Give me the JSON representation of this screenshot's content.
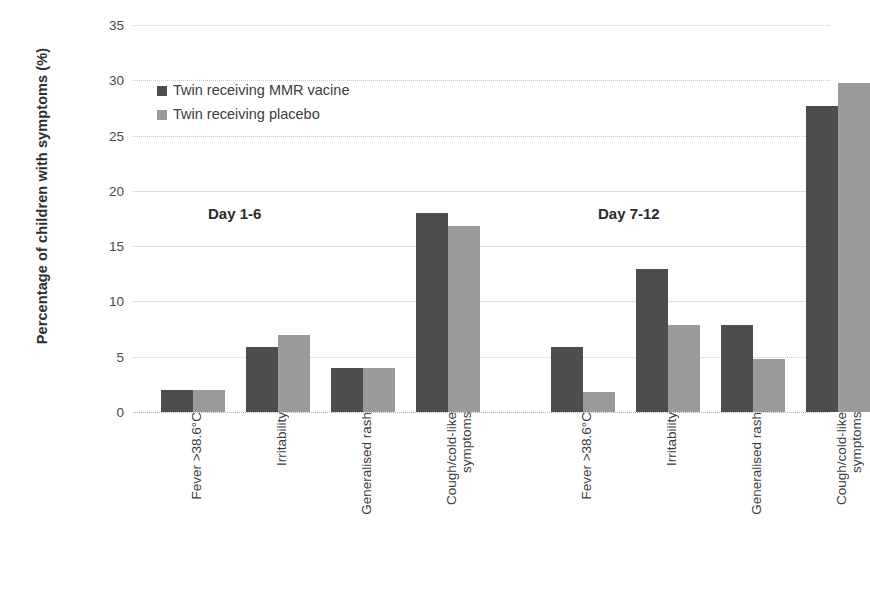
{
  "chart_data": {
    "type": "bar",
    "title": "",
    "xlabel": "",
    "ylabel": "Percentage of children with symptoms (%)",
    "ylim": [
      0,
      35
    ],
    "yticks": [
      0,
      5,
      10,
      15,
      20,
      25,
      30,
      35
    ],
    "ytick_labels": [
      "0",
      "5",
      "10",
      "15",
      "20",
      "25",
      "30",
      "35"
    ],
    "grid": true,
    "legend_position": "upper-left-inside",
    "categories": [
      "Fever >38.6°C",
      "Irritability",
      "Generalised rash",
      "Cough/cold-like\nsymptoms"
    ],
    "groups": [
      {
        "name": "Day 1-6",
        "annotation": "Day 1-6",
        "series": [
          {
            "name": "Twin receiving MMR vacine",
            "values": [
              2.0,
              5.9,
              4.0,
              18.0
            ]
          },
          {
            "name": "Twin receiving placebo",
            "values": [
              2.0,
              7.0,
              4.0,
              16.8
            ]
          }
        ]
      },
      {
        "name": "Day 7-12",
        "annotation": "Day 7-12",
        "series": [
          {
            "name": "Twin receiving MMR vacine",
            "values": [
              5.9,
              12.9,
              7.9,
              27.7
            ]
          },
          {
            "name": "Twin receiving placebo",
            "values": [
              1.8,
              7.9,
              4.8,
              29.8
            ]
          }
        ]
      }
    ],
    "series_colors": {
      "Twin receiving MMR vacine": "#4d4d4d",
      "Twin receiving placebo": "#9a9a9a"
    }
  },
  "legend": {
    "items": [
      {
        "label": "Twin receiving MMR vacine",
        "color": "#4d4d4d",
        "swatch": "dark"
      },
      {
        "label": "Twin receiving placebo",
        "color": "#9a9a9a",
        "swatch": "light"
      }
    ]
  },
  "axes": {
    "y_title": "Percentage of children with symptoms (%)"
  }
}
